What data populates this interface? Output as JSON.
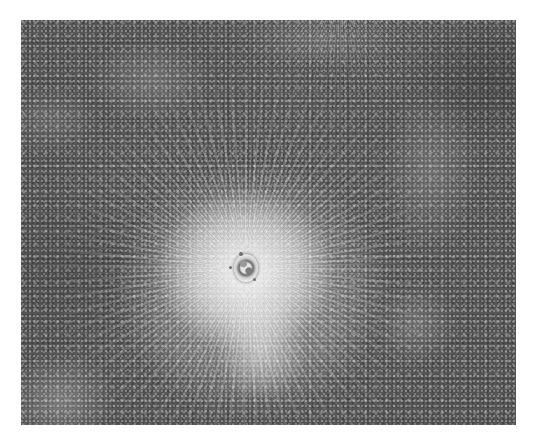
{
  "image": {
    "description": "Grayscale image of a bright rayed impact crater on a dark speckled surface",
    "palette": {
      "background": "#ffffff",
      "surface": "#565656",
      "ray_highlight": "#f2f2f2",
      "crater_rim": "#6a6a6a"
    },
    "frame": {
      "left": 21,
      "top": 20,
      "width": 495,
      "height": 405
    },
    "crater_center": {
      "x": 245,
      "y": 268
    }
  }
}
